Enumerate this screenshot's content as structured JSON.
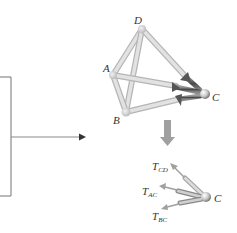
{
  "diagram": {
    "type": "truss-free-body-diagram",
    "structure": {
      "joints": [
        {
          "id": "A",
          "label": "A"
        },
        {
          "id": "B",
          "label": "B"
        },
        {
          "id": "C",
          "label": "C"
        },
        {
          "id": "D",
          "label": "D"
        }
      ],
      "members": [
        "AD",
        "BD",
        "AB",
        "AC",
        "BC",
        "CD"
      ]
    },
    "free_body": {
      "joint": "C",
      "joint_label": "C",
      "forces": [
        {
          "label": "T",
          "subscript": "CD"
        },
        {
          "label": "T",
          "subscript": "AC"
        },
        {
          "label": "T",
          "subscript": "BC"
        }
      ]
    },
    "colors": {
      "member": "#d9d9d9",
      "member_edge": "#b5b5b5",
      "arrow_dark": "#6e6e6e",
      "line": "#8a8a8a",
      "down_arrow": "#9a9a9a"
    }
  }
}
